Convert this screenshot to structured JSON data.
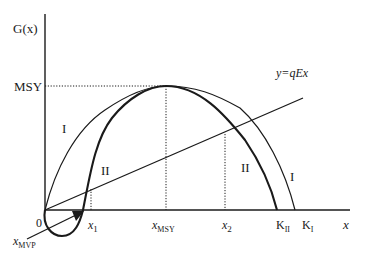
{
  "diagram": {
    "y_axis_label": "G(x)",
    "x_axis_label": "x",
    "msy_label": "MSY",
    "origin_label": "0",
    "line_label": "y=qEx",
    "curve_I_labels": [
      "I",
      "I"
    ],
    "curve_II_labels": [
      "II",
      "II"
    ],
    "x_ticks": {
      "x1": {
        "base": "x",
        "sub": "1"
      },
      "xmsy": {
        "base": "x",
        "sub": "MSY"
      },
      "x2": {
        "base": "x",
        "sub": "2"
      },
      "kII": {
        "base": "K",
        "sub": "II"
      },
      "kI": {
        "base": "K",
        "sub": "I"
      }
    },
    "mvp_label": {
      "base": "x",
      "sub": "MVP"
    },
    "colors": {
      "ink": "#1a1a1a",
      "background": "#ffffff"
    }
  }
}
